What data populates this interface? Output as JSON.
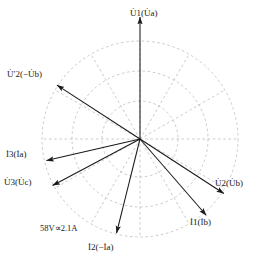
{
  "figure": {
    "type": "phasor-diagram",
    "title": "",
    "scale_note": "58V∝2.1A",
    "grid": {
      "center": [
        140,
        139
      ],
      "circle_radii": [
        38,
        68,
        98
      ],
      "spoke_step_deg": 30,
      "grid_color": "#b9b2b2",
      "grid_style": "dashed"
    },
    "vector_color": "#1a1a1a",
    "vectors": [
      {
        "id": "u1",
        "name": "U1-Ua",
        "label_main": "U",
        "label_sub": "1",
        "label_paren": "(U",
        "label_paren_sub": "a",
        "label_paren_end": ")",
        "label_text": "U̇1(U̇a)",
        "angle_deg": 90,
        "length": 122,
        "label_x": 130,
        "label_y": 9
      },
      {
        "id": "u2p",
        "name": "U2prime-negUb",
        "label_text": "U̇′2(−U̇b)",
        "angle_deg": 147,
        "length": 99,
        "label_x": 7,
        "label_y": 70
      },
      {
        "id": "i3",
        "name": "I3-Ia",
        "label_text": "İ3(İa)",
        "angle_deg": 193,
        "length": 96,
        "label_x": 6,
        "label_y": 150
      },
      {
        "id": "u3",
        "name": "U3-Uc",
        "label_text": "U̇3(U̇c)",
        "angle_deg": 208,
        "length": 99,
        "label_x": 4,
        "label_y": 178
      },
      {
        "id": "i2",
        "name": "I2-negIa",
        "label_text": "İ2(−İa)",
        "angle_deg": 256,
        "length": 97,
        "label_x": 88,
        "label_y": 243
      },
      {
        "id": "i1",
        "name": "I1-Ib",
        "label_text": "İ1(İb)",
        "angle_deg": -49,
        "length": 101,
        "label_x": 190,
        "label_y": 218
      },
      {
        "id": "u2",
        "name": "U2-Ub",
        "label_text": "U̇2(U̇b)",
        "angle_deg": -33,
        "length": 100,
        "label_x": 215,
        "label_y": 179
      }
    ]
  },
  "chart_data": {
    "type": "polar-phasor",
    "title": "",
    "xlabel": "",
    "ylabel": "",
    "annotations": [
      "58V∝2.1A"
    ],
    "legend": [],
    "grid": true,
    "radial_ticks": [
      38,
      68,
      98
    ],
    "angular_ticks_deg": [
      0,
      30,
      60,
      90,
      120,
      150,
      180,
      210,
      240,
      270,
      300,
      330
    ],
    "series": [
      {
        "name": "U̇1(U̇a)",
        "angle_deg": 90,
        "magnitude": 122
      },
      {
        "name": "U̇′2(−U̇b)",
        "angle_deg": 147,
        "magnitude": 99
      },
      {
        "name": "İ3(İa)",
        "angle_deg": 193,
        "magnitude": 96
      },
      {
        "name": "U̇3(U̇c)",
        "angle_deg": 208,
        "magnitude": 99
      },
      {
        "name": "İ2(−İa)",
        "angle_deg": 256,
        "magnitude": 97
      },
      {
        "name": "İ1(İb)",
        "angle_deg": 311,
        "magnitude": 101
      },
      {
        "name": "U̇2(U̇b)",
        "angle_deg": 327,
        "magnitude": 100
      }
    ]
  }
}
